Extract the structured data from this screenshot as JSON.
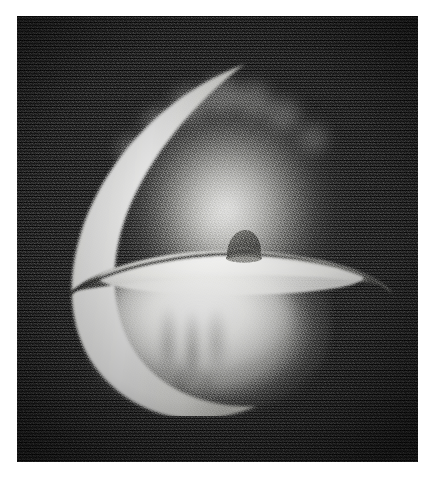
{
  "figure": {
    "caption": "",
    "medium": "black-and-white film photograph with heavy grain",
    "canvas": {
      "width": 423,
      "height": 481,
      "background_color": "#ffffff"
    },
    "plate": {
      "name": "photographic-plate",
      "left": 17,
      "top": 16,
      "width": 401,
      "height": 446,
      "background_color": "#191919",
      "grain": "heavy film grain, dark charcoal to black speckle"
    },
    "elements": [
      {
        "id": "crescent",
        "label": "bright crescent limb",
        "description": "tapering white crescent arc sweeping from upper-right down the left side and around the bottom",
        "color": "#fdfdfb",
        "bbox": {
          "x": 28,
          "y": 40,
          "w": 240,
          "h": 360
        }
      },
      {
        "id": "upper-glow",
        "label": "upper diffuse halo",
        "description": "soft grey-white hemispherical haze filling the upper half with a ragged turbulent upper boundary",
        "color": "#d8d8d5",
        "bbox": {
          "x": 75,
          "y": 25,
          "w": 272,
          "h": 270
        }
      },
      {
        "id": "equatorial-disk",
        "label": "equatorial disk plane",
        "description": "bright flattened ellipse forming a horizontal plane across the middle, with a dark lower rim edge extending to a thin tip on the right",
        "color": "#f2f2ef",
        "edge_color": "#3c3c3a",
        "bbox": {
          "x": 46,
          "y": 228,
          "w": 330,
          "h": 72
        }
      },
      {
        "id": "central-dome",
        "label": "central dome",
        "description": "small dark grey mound sitting on the centre of the disk plane",
        "color": "#5a5a58",
        "bbox": {
          "x": 206,
          "y": 209,
          "w": 42,
          "h": 40
        }
      },
      {
        "id": "lower-bulb",
        "label": "lower bright bulb",
        "description": "bright bowl-shaped cloud below the disk with wispy vertical striations converging at the bottom",
        "color": "#fafaf8",
        "bbox": {
          "x": 66,
          "y": 255,
          "w": 248,
          "h": 160
        }
      }
    ],
    "palette": {
      "background_white": "#ffffff",
      "plate_black": "#191919",
      "grain_dark": "#0a0a0a",
      "grain_light": "#4a4a4a",
      "highlight_white": "#fdfdfb",
      "halo_grey": "#d8d8d5",
      "dome_grey": "#5a5a58",
      "edge_grey": "#3c3c3a"
    }
  }
}
